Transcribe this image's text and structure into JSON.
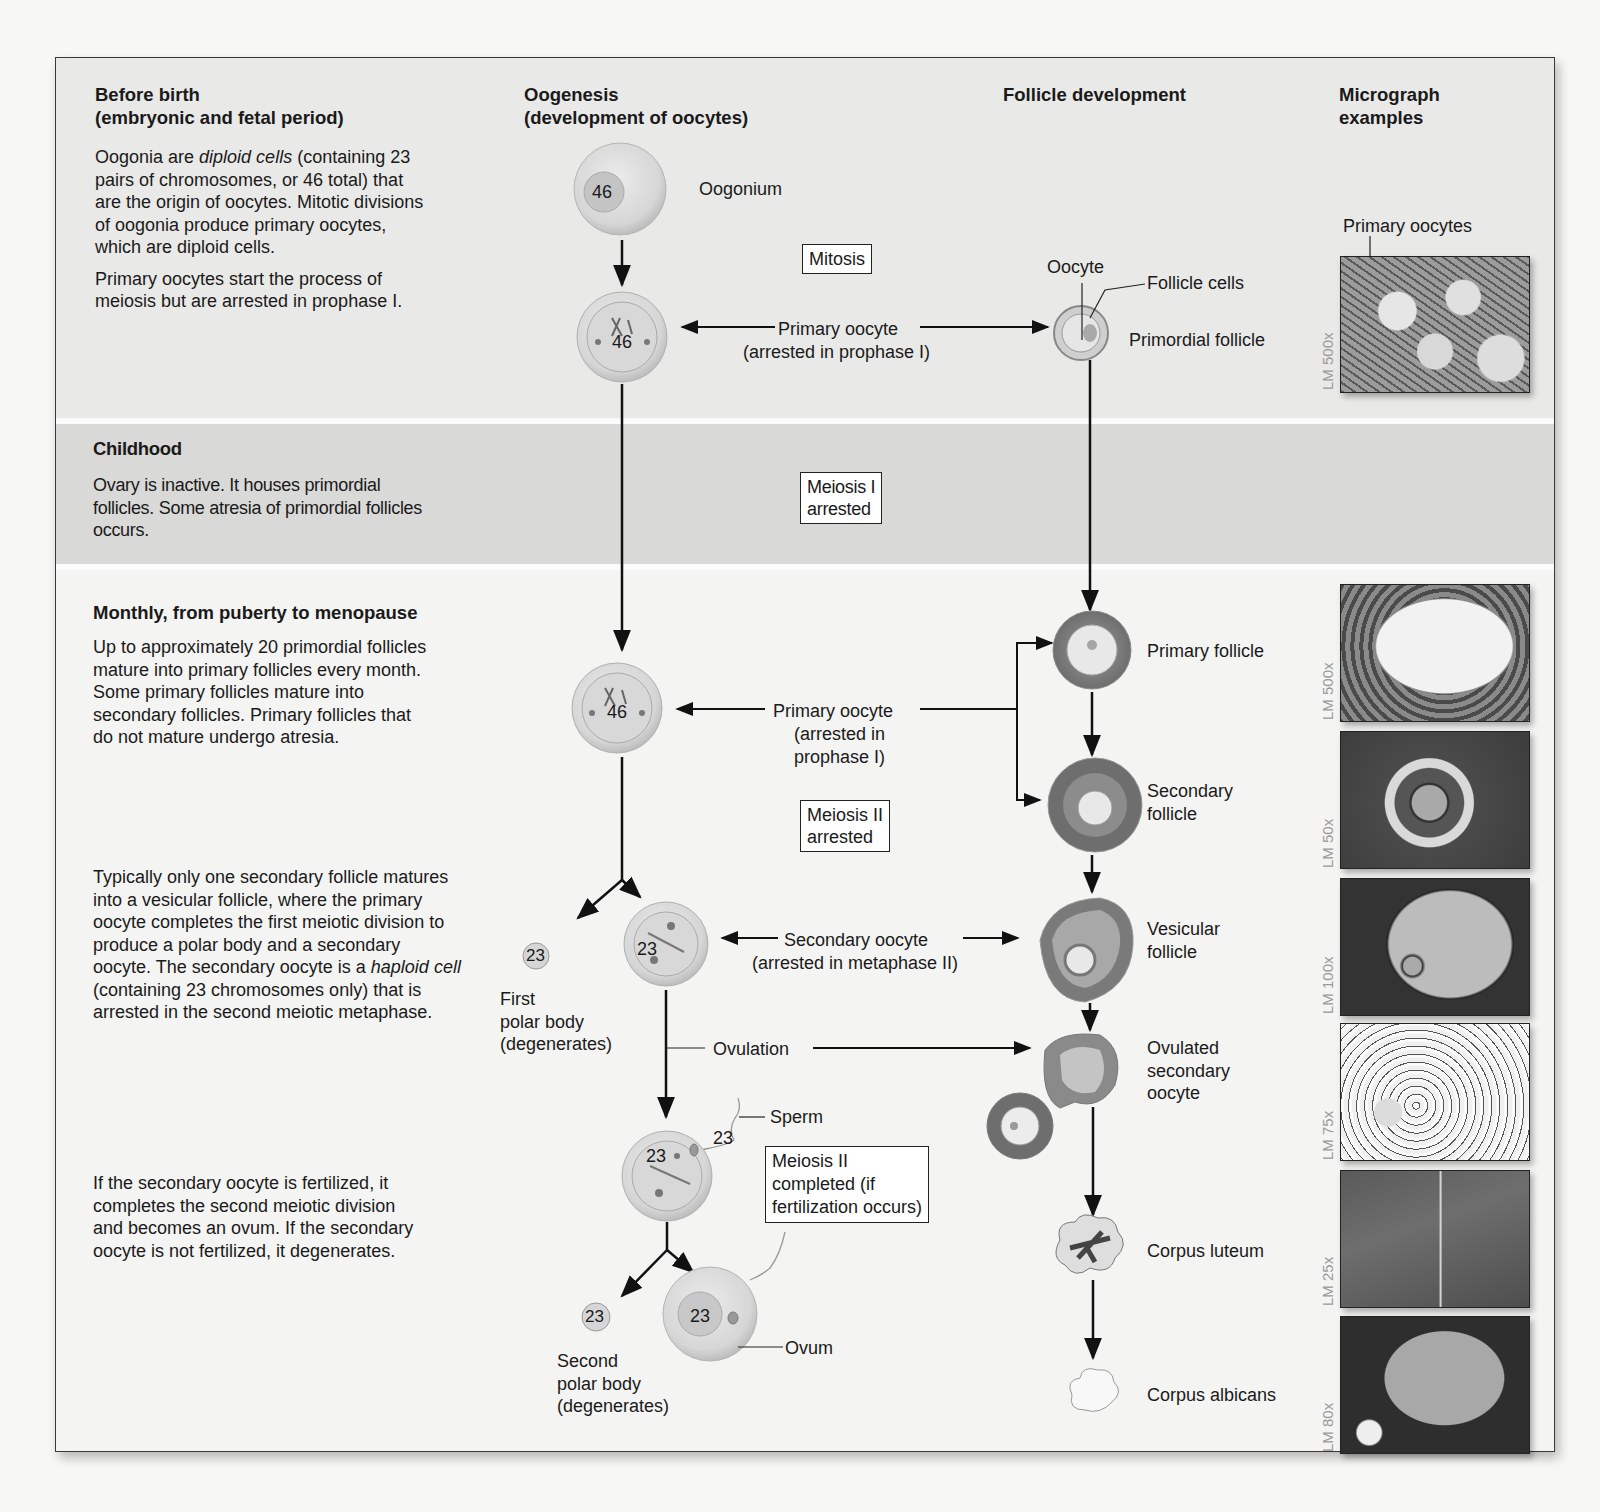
{
  "columns": {
    "period": "",
    "oogenesis": [
      "Oogenesis",
      "(development of oocytes)"
    ],
    "follicle": "Follicle development",
    "micrograph": [
      "Micrograph",
      "examples"
    ]
  },
  "periods": {
    "before_birth": {
      "title": [
        "Before birth",
        "(embryonic and fetal period)"
      ],
      "para1": [
        "Oogonia are ",
        "diploid cells",
        " (containing 23 pairs of chromosomes, or 46 total) that are the origin of oocytes. Mitotic divisions of oogonia produce primary oocytes, which are diploid cells."
      ],
      "para2": "Primary oocytes start the process of meiosis but are arrested in prophase I."
    },
    "childhood": {
      "title": "Childhood",
      "para": "Ovary is inactive. It houses primordial follicles. Some atresia of primordial follicles occurs."
    },
    "monthly": {
      "title": "Monthly, from puberty to menopause",
      "para1": "Up to approximately 20 primordial follicles mature into primary follicles every month. Some primary follicles mature into secondary follicles. Primary follicles that do not mature undergo atresia.",
      "para2": [
        "Typically only one secondary follicle matures into a vesicular follicle, where the primary oocyte completes the first meiotic division to produce a polar body and a secondary oocyte. The secondary oocyte is a ",
        "haploid cell",
        " (containing 23 chromosomes only) that is arrested in the second meiotic metaphase."
      ],
      "para3": "If the secondary oocyte is fertilized, it completes the second meiotic division and becomes an ovum. If the secondary oocyte is not fertilized, it degenerates."
    }
  },
  "oogenesis": {
    "oogonium": {
      "label": "Oogonium",
      "chromosomes": "46"
    },
    "mitosis_box": "Mitosis",
    "primary_oocyte_1": {
      "chromosomes": "46",
      "label": "Primary oocyte",
      "sub": "(arrested in prophase I)"
    },
    "meiosis1_box": [
      "Meiosis I",
      "arrested"
    ],
    "primary_oocyte_2": {
      "chromosomes": "46",
      "label": "Primary oocyte",
      "sub": [
        "(arrested in",
        "prophase I)"
      ]
    },
    "meiosis2_box": [
      "Meiosis II",
      "arrested"
    ],
    "first_polar_body": {
      "chromosomes": "23",
      "label": [
        "First",
        "polar body",
        "(degenerates)"
      ]
    },
    "secondary_oocyte": {
      "chromosomes": "23",
      "label": "Secondary oocyte",
      "sub": "(arrested in metaphase II)"
    },
    "ovulation": "Ovulation",
    "sperm": {
      "label": "Sperm",
      "chromosomes": "23"
    },
    "fertilized": {
      "chromosomes": "23"
    },
    "meiosis2_complete_box": [
      "Meiosis II",
      "completed (if",
      "fertilization occurs)"
    ],
    "second_polar_body": {
      "chromosomes": "23",
      "label": [
        "Second",
        "polar body",
        "(degenerates)"
      ]
    },
    "ovum": {
      "chromosomes": "23",
      "label": "Ovum"
    }
  },
  "follicles": {
    "oocyte": "Oocyte",
    "follicle_cells": "Follicle cells",
    "primordial": "Primordial follicle",
    "primary": "Primary follicle",
    "secondary": [
      "Secondary",
      "follicle"
    ],
    "vesicular": [
      "Vesicular",
      "follicle"
    ],
    "ovulated": [
      "Ovulated",
      "secondary",
      "oocyte"
    ],
    "corpus_luteum": "Corpus luteum",
    "corpus_albicans": "Corpus albicans"
  },
  "micrographs": [
    {
      "caption": "Primary oocytes",
      "mag": "LM 500x"
    },
    {
      "caption": "",
      "mag": "LM 500x"
    },
    {
      "caption": "",
      "mag": "LM 50x"
    },
    {
      "caption": "",
      "mag": "LM 100x"
    },
    {
      "caption": "",
      "mag": "LM 75x"
    },
    {
      "caption": "",
      "mag": "LM 25x"
    },
    {
      "caption": "",
      "mag": "LM 80x"
    }
  ]
}
